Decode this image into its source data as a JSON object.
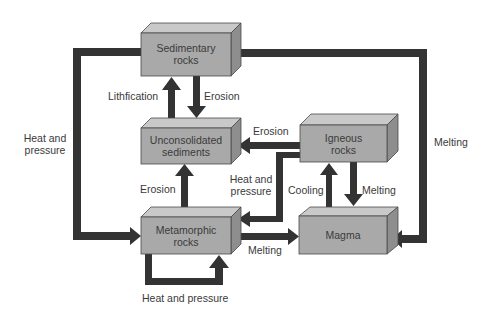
{
  "colors": {
    "box_front": "#a9a9a9",
    "box_top": "#c9c9c9",
    "box_side": "#8e8e8e",
    "box_stroke": "#4a4a4a",
    "arrow": "#333333",
    "text": "#3a3a3a",
    "background": "#ffffff"
  },
  "nodes": {
    "sedimentary": {
      "line1": "Sedimentary",
      "line2": "rocks"
    },
    "unconsolidated": {
      "line1": "Unconsolidated",
      "line2": "sediments"
    },
    "igneous": {
      "line1": "Igneous",
      "line2": "rocks"
    },
    "metamorphic": {
      "line1": "Metamorphic",
      "line2": "rocks"
    },
    "magma": {
      "line1": "Magma"
    }
  },
  "edges": {
    "lithification": "Lithfication",
    "erosion_sed_to_unc": "Erosion",
    "erosion_ign_to_unc": "Erosion",
    "erosion_met_to_unc": "Erosion",
    "heat_pressure_sed_to_met": {
      "line1": "Heat and",
      "line2": "pressure"
    },
    "heat_pressure_ign_to_met": {
      "line1": "Heat and",
      "line2": "pressure"
    },
    "heat_pressure_met_loop": "Heat and pressure",
    "melting_sed_to_magma": "Melting",
    "melting_met_to_magma": "Melting",
    "melting_ign_to_magma": "Melting",
    "cooling": "Cooling"
  }
}
